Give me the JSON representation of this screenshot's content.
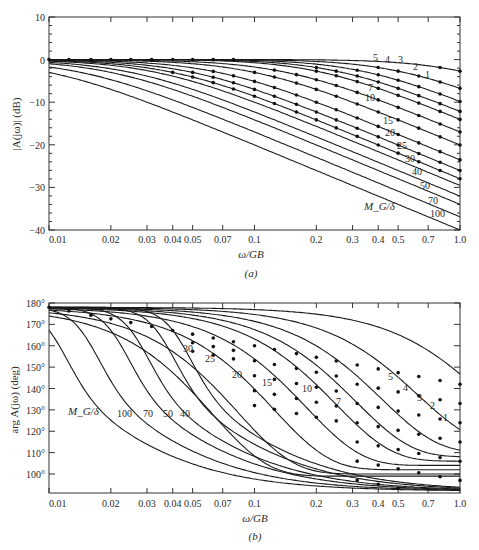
{
  "chart_data": [
    {
      "id": "a",
      "type": "line",
      "panel_label": "(a)",
      "title": "",
      "xlabel": "ω/GB",
      "ylabel": "|A(jω)| (dB)",
      "xscale": "log",
      "xlim": [
        0.01,
        1.0
      ],
      "ylim": [
        -40,
        10
      ],
      "x_ticks": [
        0.01,
        0.02,
        0.03,
        0.04,
        0.05,
        0.07,
        0.1,
        0.2,
        0.3,
        0.4,
        0.5,
        0.7,
        1.0
      ],
      "x_tick_labels": [
        "0.01",
        "0.02",
        "0.03",
        "0.04 0.05",
        "",
        "0.07",
        "0.1",
        "0.2",
        "0.3",
        "0.4",
        "0.5",
        "0.7",
        "1.0"
      ],
      "y_ticks": [
        10,
        0,
        -10,
        -20,
        -30,
        -40
      ],
      "y_tick_labels": [
        "10",
        "0",
        "−10",
        "−20",
        "−30",
        "−40"
      ],
      "grid": false,
      "parameter_label": "M_G/δ",
      "series_params": [
        1,
        2,
        3,
        4,
        5,
        7,
        10,
        15,
        20,
        25,
        30,
        40,
        50,
        70,
        100
      ],
      "series_end_values_db": {
        "1": -6.5,
        "2": -8,
        "3": -9,
        "4": -10.5,
        "5": -12,
        "7": -14.5,
        "10": -17.5,
        "15": -21,
        "20": -23.5,
        "25": -25.5,
        "30": -27.5,
        "40": -30,
        "50": -32,
        "70": -35,
        "100": -38
      },
      "series_labels": [
        "1",
        "2",
        "3",
        "4",
        "5",
        "7",
        "10",
        "15",
        "20",
        "25",
        "30",
        "40",
        "50",
        "70",
        "100"
      ],
      "notes": "Curves flat at 0 dB then roll off ~-20 dB/decade; corner frequency ≈ 1/(M_G/δ). Dots mark sampled points along each curve."
    },
    {
      "id": "b",
      "type": "line",
      "panel_label": "(b)",
      "title": "",
      "xlabel": "ω/GB",
      "ylabel": "arg A(jω) (deg)",
      "xscale": "log",
      "xlim": [
        0.01,
        1.0
      ],
      "ylim": [
        92,
        180
      ],
      "x_ticks": [
        0.01,
        0.02,
        0.03,
        0.04,
        0.05,
        0.07,
        0.1,
        0.2,
        0.3,
        0.4,
        0.5,
        0.7,
        1.0
      ],
      "x_tick_labels": [
        "0.01",
        "0.02",
        "0.03",
        "0.04",
        "0.05",
        "0.07",
        "0.1",
        "0.2",
        "0.3",
        "0.4",
        "0.5",
        "0.7",
        "1.0"
      ],
      "y_ticks": [
        180,
        170,
        160,
        150,
        140,
        130,
        120,
        110,
        100
      ],
      "y_tick_labels": [
        "180°",
        "170°",
        "160°",
        "150°",
        "140°",
        "130°",
        "120°",
        "110°",
        "100°"
      ],
      "grid": false,
      "parameter_label": "M_G/δ",
      "series_params": [
        1,
        2,
        3,
        4,
        5,
        7,
        10,
        15,
        20,
        25,
        30,
        40,
        50,
        70,
        100
      ],
      "series_end_values_deg": {
        "1": 116,
        "2": 113,
        "3": 110,
        "4": 108,
        "5": 106,
        "7": 104,
        "10": 102,
        "15": 100,
        "20": 99,
        "25": 98,
        "30": 97,
        "40": 96.5,
        "50": 96,
        "70": 95.5,
        "100": 95
      },
      "series_labels": [
        "1",
        "2",
        "3",
        "4",
        "5",
        "7",
        "10",
        "15",
        "20",
        "25",
        "30",
        "40",
        "50",
        "70",
        "100"
      ],
      "notes": "Phase starts near 178° and drops toward ~90°; larger M_G/δ drops at lower frequency."
    }
  ],
  "panels": {
    "a": {
      "ylabel": "|A(jω)| (dB)",
      "xlabel": "ω/GB",
      "caption": "(a)",
      "param": "M_G/δ",
      "yt": [
        "10",
        "0",
        "−10",
        "−20",
        "−30",
        "−40"
      ],
      "xt": [
        "0.01",
        "0.02",
        "0.03",
        "0.04",
        "0.05",
        "0.07",
        "0.1",
        "0.2",
        "0.3",
        "0.4",
        "0.5",
        "0.7",
        "1.0"
      ]
    },
    "b": {
      "ylabel": "arg A(jω) (deg)",
      "xlabel": "ω/GB",
      "caption": "(b)",
      "param": "M_G/δ",
      "yt": [
        "180°",
        "170°",
        "160°",
        "150°",
        "140°",
        "130°",
        "120°",
        "110°",
        "100°"
      ],
      "xt": [
        "0.01",
        "0.02",
        "0.03",
        "0.04",
        "0.05",
        "0.07",
        "0.1",
        "0.2",
        "0.3",
        "0.4",
        "0.5",
        "0.7",
        "1.0"
      ]
    }
  }
}
